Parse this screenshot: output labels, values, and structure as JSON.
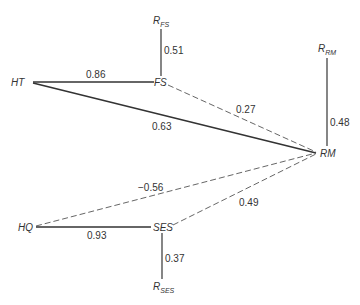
{
  "diagram": {
    "type": "path-diagram",
    "nodes": [
      {
        "id": "HT",
        "label": "HT"
      },
      {
        "id": "FS",
        "label": "FS"
      },
      {
        "id": "RM",
        "label": "RM"
      },
      {
        "id": "HQ",
        "label": "HQ"
      },
      {
        "id": "SES",
        "label": "SES"
      },
      {
        "id": "R_FS",
        "label": "R",
        "subscript": "FS"
      },
      {
        "id": "R_RM",
        "label": "R",
        "subscript": "RM"
      },
      {
        "id": "R_SES",
        "label": "R",
        "subscript": "SES"
      }
    ],
    "edges": [
      {
        "from": "HT",
        "to": "FS",
        "coefficient": "0.86",
        "style": "solid"
      },
      {
        "from": "HT",
        "to": "RM",
        "coefficient": "0.63",
        "style": "solid"
      },
      {
        "from": "FS",
        "to": "RM",
        "coefficient": "0.27",
        "style": "dashed"
      },
      {
        "from": "R_FS",
        "to": "FS",
        "coefficient": "0.51",
        "style": "solid"
      },
      {
        "from": "R_RM",
        "to": "RM",
        "coefficient": "0.48",
        "style": "solid"
      },
      {
        "from": "HQ",
        "to": "RM",
        "coefficient": "−0.56",
        "style": "dashed"
      },
      {
        "from": "HQ",
        "to": "SES",
        "coefficient": "0.93",
        "style": "solid"
      },
      {
        "from": "SES",
        "to": "RM",
        "coefficient": "0.49",
        "style": "dashed"
      },
      {
        "from": "R_SES",
        "to": "SES",
        "coefficient": "0.37",
        "style": "solid"
      }
    ]
  },
  "labels": {
    "ht": "HT",
    "fs": "FS",
    "rm": "RM",
    "hq": "HQ",
    "ses": "SES",
    "r": "R",
    "r_fs_sub": "FS",
    "r_rm_sub": "RM",
    "r_ses_sub": "SES"
  },
  "coefficients": {
    "ht_fs": "0.86",
    "ht_rm": "0.63",
    "fs_rm": "0.27",
    "rfs_fs": "0.51",
    "rrm_rm": "0.48",
    "hq_rm": "−0.56",
    "hq_ses": "0.93",
    "ses_rm": "0.49",
    "rses_ses": "0.37"
  }
}
